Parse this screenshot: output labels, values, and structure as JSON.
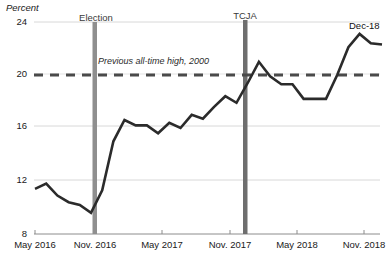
{
  "chart_data": {
    "type": "line",
    "title": "",
    "subtitle": "",
    "ylabel": "Percent",
    "xlabel": "",
    "ylim": [
      8,
      24
    ],
    "yticks": [
      8,
      12,
      16,
      20,
      24
    ],
    "ytick_labels": [
      "8",
      "12",
      "16",
      "20",
      "24"
    ],
    "xticks": [
      "May 2016",
      "Nov. 2016",
      "May 2017",
      "Nov. 2017",
      "May 2018",
      "Nov. 2018"
    ],
    "grid": "horizontal",
    "legend": "none",
    "x_start_month": "May 2016",
    "x_end_month": "Dec 2018",
    "series": [
      {
        "name": "Series",
        "color": "#2b2b2b",
        "x": [
          "May 2016",
          "Jun 2016",
          "Jul 2016",
          "Aug 2016",
          "Sep 2016",
          "Oct 2016",
          "Nov 2016",
          "Dec 2016",
          "Jan 2017",
          "Feb 2017",
          "Mar 2017",
          "Apr 2017",
          "May 2017",
          "Jun 2017",
          "Jul 2017",
          "Aug 2017",
          "Sep 2017",
          "Oct 2017",
          "Nov 2017",
          "Dec 2017",
          "Jan 2018",
          "Feb 2018",
          "Mar 2018",
          "Apr 2018",
          "May 2018",
          "Jun 2018",
          "Jul 2018",
          "Aug 2018",
          "Sep 2018",
          "Oct 2018",
          "Nov 2018",
          "Dec 2018"
        ],
        "values": [
          11.4,
          11.8,
          10.9,
          10.4,
          10.2,
          9.6,
          11.3,
          15.0,
          16.6,
          16.2,
          16.2,
          15.6,
          16.4,
          16.0,
          17.0,
          16.7,
          17.6,
          18.4,
          17.9,
          19.4,
          21.0,
          19.9,
          19.3,
          19.3,
          18.2,
          18.2,
          18.2,
          20.0,
          22.1,
          23.1,
          22.4,
          22.3
        ]
      }
    ],
    "reference_line": {
      "label": "Previous all-time high, 2000",
      "value": 20,
      "style": "dashed",
      "color": "#4a4a4a"
    },
    "event_markers": [
      {
        "label": "Election",
        "x": "Nov 2016",
        "color": "#8a8a8a"
      },
      {
        "label": "TCJA",
        "x": "Dec 2017",
        "color": "#6b6b6b"
      }
    ],
    "annotations": [
      {
        "label": "Dec-18",
        "x": "Dec 2018",
        "y": 22.3
      }
    ]
  }
}
